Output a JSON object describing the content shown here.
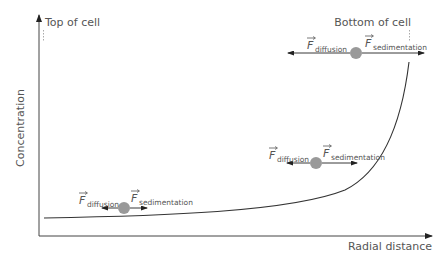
{
  "diagram": {
    "axes": {
      "y_label": "Concentration",
      "x_label": "Radial distance"
    },
    "markers": {
      "top": "Top of cell",
      "bottom": "Bottom of cell"
    },
    "forces": [
      {
        "name": "bottom-left",
        "diffusion_symbol": "F",
        "diffusion_sub": "diffusion",
        "sedimentation_symbol": "F",
        "sedimentation_sub": "sedimentation"
      },
      {
        "name": "middle",
        "diffusion_symbol": "F",
        "diffusion_sub": "diffusion",
        "sedimentation_symbol": "F",
        "sedimentation_sub": "sedimentation"
      },
      {
        "name": "top-right",
        "diffusion_symbol": "F",
        "diffusion_sub": "diffusion",
        "sedimentation_symbol": "F",
        "sedimentation_sub": "sedimentation"
      }
    ],
    "colors": {
      "axis": "#333333",
      "curve": "#333333",
      "particle": "#999999",
      "text": "#555555",
      "marker_line": "#aaaaaa"
    }
  }
}
